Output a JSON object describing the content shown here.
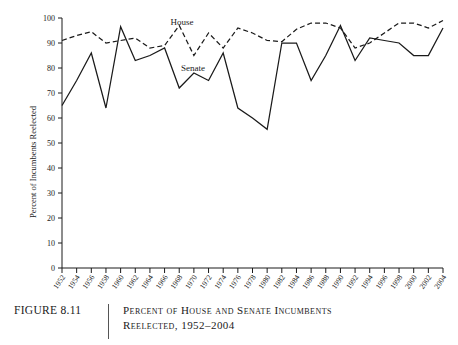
{
  "figure": {
    "number_label": "FIGURE 8.11",
    "caption_line1": "Percent of House and Senate Incumbents",
    "caption_line2": "Reelected, 1952–2004"
  },
  "chart_data": {
    "type": "line",
    "title": "",
    "xlabel": "",
    "ylabel": "Percent of Incumbents Reelected",
    "ylim": [
      0,
      100
    ],
    "ytick_labels": [
      "0",
      "10",
      "20",
      "30",
      "40",
      "50",
      "60",
      "70",
      "80",
      "90",
      "100"
    ],
    "yticks": [
      0,
      10,
      20,
      30,
      40,
      50,
      60,
      70,
      80,
      90,
      100
    ],
    "grid": false,
    "legend_position": "inline-labels",
    "categories": [
      "1952",
      "1954",
      "1956",
      "1958",
      "1960",
      "1962",
      "1964",
      "1966",
      "1968",
      "1970",
      "1972",
      "1974",
      "1976",
      "1978",
      "1980",
      "1982",
      "1984",
      "1986",
      "1988",
      "1990",
      "1992",
      "1994",
      "1996",
      "1998",
      "2000",
      "2002",
      "2004"
    ],
    "series": [
      {
        "name": "House",
        "style": "dashed",
        "label_text": "House",
        "values": [
          91,
          93,
          94.5,
          90,
          91,
          92,
          88,
          89,
          97,
          85,
          94,
          88,
          96,
          94,
          91,
          90.5,
          95.5,
          98,
          98,
          96,
          88,
          90,
          94,
          98,
          98,
          96,
          99
        ]
      },
      {
        "name": "Senate",
        "style": "solid",
        "label_text": "Senate",
        "values": [
          65,
          75,
          86,
          64,
          96.5,
          83,
          85,
          88,
          72,
          78,
          75,
          86,
          64,
          60,
          55.5,
          90,
          90,
          75,
          85,
          97,
          83,
          92,
          91,
          90,
          85,
          85,
          96
        ]
      }
    ]
  }
}
